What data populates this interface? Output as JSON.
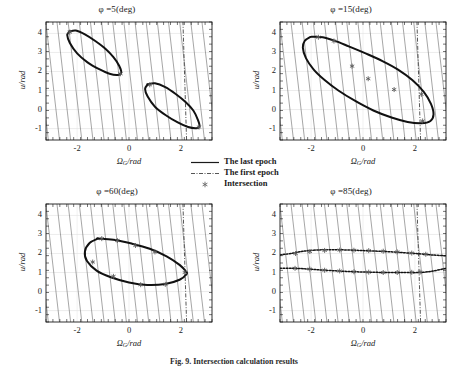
{
  "figure": {
    "caption": "Fig. 9.  Intersection calculation results",
    "panel_count": 4
  },
  "legend": {
    "items": [
      {
        "label": "The last epoch",
        "style": "solid-line",
        "color": "#1a1a1a"
      },
      {
        "label": "The first epoch",
        "style": "dash-dot-line",
        "color": "#555555"
      },
      {
        "label": "Intersection",
        "style": "star-marker",
        "color": "#666666"
      }
    ]
  },
  "axes": {
    "xlabel": "ΩG/rad",
    "xlabel_main": "Ω",
    "xlabel_sub": "G",
    "xlabel_rest": "/rad",
    "ylabel": "u/rad",
    "xticks": [
      "-2",
      "0",
      "2"
    ],
    "xtick_values": [
      -2,
      0,
      2
    ],
    "yticks": [
      "-1",
      "0",
      "1",
      "2",
      "3",
      "4"
    ],
    "ytick_values": [
      -1,
      0,
      1,
      2,
      3,
      4
    ],
    "xlim": [
      -3.2,
      3.2
    ],
    "ylim": [
      -1.6,
      4.6
    ],
    "grid": true
  },
  "chart_data": [
    {
      "type": "line",
      "id": "panel-phi-5",
      "title": "φ =5(deg)",
      "phi_deg": 5,
      "xlabel": "ΩG/rad",
      "ylabel": "u/rad",
      "xlim": [
        -3.2,
        3.2
      ],
      "ylim": [
        -1.6,
        4.6
      ],
      "xticks": [
        -2,
        0,
        2
      ],
      "yticks": [
        -1,
        0,
        1,
        2,
        3,
        4
      ],
      "grid": true,
      "series": [
        {
          "name": "The last epoch",
          "style": "solid",
          "comment": "two separate slanted closed loops",
          "loops": [
            {
              "name": "upper-left-loop",
              "x": [
                -2.3,
                -2.05,
                -1.7,
                -1.3,
                -0.9,
                -0.6,
                -0.38,
                -0.3,
                -0.42,
                -0.75,
                -1.15,
                -1.6,
                -2.0,
                -2.28,
                -2.38,
                -2.3
              ],
              "y": [
                4.1,
                4.15,
                3.95,
                3.6,
                3.18,
                2.75,
                2.3,
                1.95,
                1.82,
                1.88,
                2.12,
                2.48,
                2.95,
                3.5,
                3.9,
                4.1
              ]
            },
            {
              "name": "lower-right-loop",
              "x": [
                0.72,
                1.0,
                1.4,
                1.8,
                2.18,
                2.48,
                2.66,
                2.72,
                2.6,
                2.28,
                1.88,
                1.42,
                1.0,
                0.72,
                0.62,
                0.72
              ],
              "y": [
                1.32,
                1.38,
                1.18,
                0.82,
                0.4,
                -0.05,
                -0.55,
                -0.88,
                -0.98,
                -0.92,
                -0.68,
                -0.3,
                0.15,
                0.68,
                1.08,
                1.32
              ]
            }
          ]
        },
        {
          "name": "The first epoch",
          "style": "dash-dot",
          "comment": "near-vertical line at x ~ 2.15",
          "x": [
            2.22,
            2.08
          ],
          "y": [
            -1.6,
            4.6
          ]
        },
        {
          "name": "Intersection",
          "style": "star-marker",
          "points": [
            {
              "x": -2.28,
              "y": 4.07
            },
            {
              "x": -0.33,
              "y": 1.88
            },
            {
              "x": 0.8,
              "y": 1.3
            },
            {
              "x": 2.7,
              "y": -0.92
            }
          ]
        }
      ]
    },
    {
      "type": "line",
      "id": "panel-phi-15",
      "title": "φ =15(deg)",
      "phi_deg": 15,
      "xlabel": "ΩG/rad",
      "ylabel": "u/rad",
      "xlim": [
        -3.2,
        3.2
      ],
      "ylim": [
        -1.6,
        4.6
      ],
      "xticks": [
        -2,
        0,
        2
      ],
      "yticks": [
        -1,
        0,
        1,
        2,
        3,
        4
      ],
      "grid": true,
      "series": [
        {
          "name": "The last epoch",
          "style": "solid",
          "comment": "single large S-shaped closed loop",
          "loops": [
            {
              "name": "s-shaped-loop",
              "x": [
                -1.95,
                -1.55,
                -1.1,
                -0.55,
                0.1,
                0.75,
                1.35,
                1.9,
                2.35,
                2.62,
                2.72,
                2.6,
                2.25,
                1.72,
                1.1,
                0.4,
                -0.3,
                -0.95,
                -1.48,
                -1.9,
                -2.2,
                -2.32,
                -2.25,
                -2.05,
                -1.95
              ],
              "y": [
                3.82,
                3.8,
                3.62,
                3.32,
                2.95,
                2.55,
                2.1,
                1.55,
                0.92,
                0.3,
                -0.25,
                -0.6,
                -0.72,
                -0.65,
                -0.42,
                -0.05,
                0.45,
                1.0,
                1.55,
                2.1,
                2.7,
                3.25,
                3.6,
                3.8,
                3.82
              ]
            }
          ]
        },
        {
          "name": "The first epoch",
          "style": "dash-dot",
          "x": [
            2.22,
            2.08
          ],
          "y": [
            -1.6,
            4.6
          ]
        },
        {
          "name": "Intersection",
          "style": "star-marker",
          "points": [
            {
              "x": -1.72,
              "y": 3.8
            },
            {
              "x": -1.12,
              "y": 3.6
            },
            {
              "x": -0.42,
              "y": 2.28
            },
            {
              "x": 0.2,
              "y": 1.62
            },
            {
              "x": 1.2,
              "y": 1.05
            },
            {
              "x": 2.25,
              "y": 0.8
            },
            {
              "x": 2.3,
              "y": -0.6
            }
          ]
        }
      ]
    },
    {
      "type": "line",
      "id": "panel-phi-60",
      "title": "φ =60(deg)",
      "phi_deg": 60,
      "xlabel": "ΩG/rad",
      "ylabel": "u/rad",
      "xlim": [
        -3.2,
        3.2
      ],
      "ylim": [
        -1.6,
        4.6
      ],
      "xticks": [
        -2,
        0,
        2
      ],
      "yticks": [
        -1,
        0,
        1,
        2,
        3,
        4
      ],
      "grid": true,
      "series": [
        {
          "name": "The last epoch",
          "style": "solid",
          "comment": "single flat slanted ellipse",
          "loops": [
            {
              "name": "flat-ellipse",
              "x": [
                -1.2,
                -0.6,
                0.1,
                0.8,
                1.45,
                1.95,
                2.2,
                2.22,
                1.95,
                1.4,
                0.7,
                0.0,
                -0.7,
                -1.25,
                -1.62,
                -1.7,
                -1.52,
                -1.2
              ],
              "y": [
                2.78,
                2.72,
                2.52,
                2.25,
                1.85,
                1.4,
                1.05,
                0.92,
                0.62,
                0.4,
                0.35,
                0.48,
                0.75,
                1.1,
                1.6,
                2.1,
                2.55,
                2.78
              ]
            }
          ]
        },
        {
          "name": "The first epoch",
          "style": "dash-dot",
          "x": [
            2.22,
            2.08
          ],
          "y": [
            -1.6,
            4.6
          ]
        },
        {
          "name": "Intersection",
          "style": "star-marker",
          "points": [
            {
              "x": -1.05,
              "y": 2.78
            },
            {
              "x": -0.45,
              "y": 2.68
            },
            {
              "x": 0.25,
              "y": 2.42
            },
            {
              "x": 1.0,
              "y": 2.08
            },
            {
              "x": 2.15,
              "y": 1.0
            },
            {
              "x": 1.4,
              "y": 0.38
            },
            {
              "x": 0.45,
              "y": 0.36
            },
            {
              "x": -0.6,
              "y": 0.8
            },
            {
              "x": -1.4,
              "y": 1.55
            }
          ]
        }
      ]
    },
    {
      "type": "line",
      "id": "panel-phi-85",
      "title": "φ =85(deg)",
      "phi_deg": 85,
      "xlabel": "ΩG/rad",
      "ylabel": "u/rad",
      "xlim": [
        -3.2,
        3.2
      ],
      "ylim": [
        -1.6,
        4.6
      ],
      "xticks": [
        -2,
        0,
        2
      ],
      "yticks": [
        -1,
        0,
        1,
        2,
        3,
        4
      ],
      "grid": true,
      "series": [
        {
          "name": "The last epoch",
          "style": "solid",
          "comment": "two nearly-horizontal branches near u=2 and u=1",
          "loops": [
            {
              "name": "upper-branch",
              "x": [
                -3.2,
                -2.7,
                -2.3,
                -1.8,
                -1.2,
                -0.5,
                0.2,
                0.9,
                1.6,
                2.2,
                2.7,
                3.2
              ],
              "y": [
                1.92,
                2.02,
                2.12,
                2.18,
                2.2,
                2.18,
                2.14,
                2.1,
                2.04,
                1.98,
                1.92,
                1.88
              ]
            },
            {
              "name": "lower-branch",
              "x": [
                -3.2,
                -2.7,
                -2.3,
                -1.8,
                -1.2,
                -0.5,
                0.2,
                0.9,
                1.6,
                2.2,
                2.7,
                3.2
              ],
              "y": [
                1.22,
                1.22,
                1.2,
                1.15,
                1.1,
                1.05,
                1.02,
                1.0,
                1.0,
                1.0,
                1.08,
                1.22
              ]
            }
          ]
        },
        {
          "name": "The first epoch",
          "style": "dash-dot",
          "x": [
            2.22,
            2.08
          ],
          "y": [
            -1.6,
            4.6
          ]
        },
        {
          "name": "Intersection",
          "style": "star-marker",
          "points": [
            {
              "x": -2.6,
              "y": 2.0
            },
            {
              "x": -2.05,
              "y": 2.1
            },
            {
              "x": -1.48,
              "y": 2.16
            },
            {
              "x": -0.9,
              "y": 2.18
            },
            {
              "x": -0.35,
              "y": 2.17
            },
            {
              "x": 0.22,
              "y": 2.15
            },
            {
              "x": 0.78,
              "y": 2.12
            },
            {
              "x": 1.32,
              "y": 2.08
            },
            {
              "x": 1.88,
              "y": 2.02
            },
            {
              "x": 2.42,
              "y": 1.96
            },
            {
              "x": -2.62,
              "y": 1.22
            },
            {
              "x": -2.05,
              "y": 1.18
            },
            {
              "x": -1.48,
              "y": 1.12
            },
            {
              "x": -0.9,
              "y": 1.08
            },
            {
              "x": -0.35,
              "y": 1.04
            },
            {
              "x": 0.22,
              "y": 1.02
            },
            {
              "x": 0.78,
              "y": 1.0
            },
            {
              "x": 1.32,
              "y": 1.0
            },
            {
              "x": 1.88,
              "y": 1.01
            },
            {
              "x": 2.2,
              "y": 1.02
            }
          ]
        }
      ]
    }
  ]
}
